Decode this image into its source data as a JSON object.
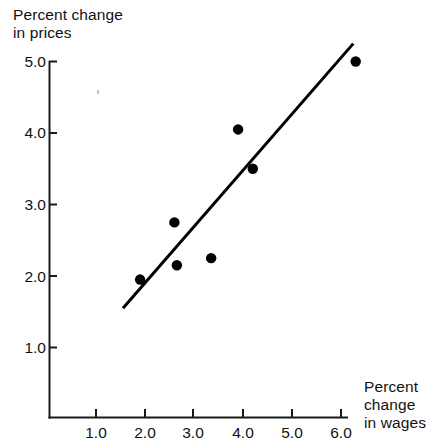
{
  "chart_data": {
    "type": "scatter",
    "title": "",
    "xlabel": "Percent change in wages",
    "ylabel": "Percent change in prices",
    "xlabel_lines": [
      "Percent",
      "change",
      "in wages"
    ],
    "ylabel_lines": [
      "Percent change",
      "in prices"
    ],
    "x_ticks": [
      "1.0",
      "2.0",
      "3.0",
      "4.0",
      "5.0",
      "6.0"
    ],
    "x_tick_values": [
      1.0,
      2.0,
      3.0,
      4.0,
      5.0,
      6.0
    ],
    "y_ticks": [
      "1.0",
      "2.0",
      "3.0",
      "4.0",
      "5.0"
    ],
    "y_tick_values": [
      1.0,
      2.0,
      3.0,
      4.0,
      5.0
    ],
    "xlim": [
      0.0,
      6.6
    ],
    "ylim": [
      0.5,
      5.2
    ],
    "grid": false,
    "legend": null,
    "points": [
      {
        "x": 1.9,
        "y": 1.95
      },
      {
        "x": 2.6,
        "y": 2.75
      },
      {
        "x": 2.65,
        "y": 2.15
      },
      {
        "x": 3.35,
        "y": 2.25
      },
      {
        "x": 3.9,
        "y": 4.05
      },
      {
        "x": 4.2,
        "y": 3.5
      },
      {
        "x": 6.3,
        "y": 5.0
      }
    ],
    "trend_line": {
      "type": "best-fit-line",
      "x_start": 1.55,
      "y_start": 1.55,
      "x_end": 6.25,
      "y_end": 5.25
    },
    "marker_color": "#000000",
    "line_color": "#000000",
    "axis_color": "#1a1a1a",
    "background_color": "#ffffff"
  },
  "axis_labels": {
    "y_title_line1": "Percent change",
    "y_title_line2": "in prices",
    "x_title_line1": "Percent",
    "x_title_line2": "change",
    "x_title_line3": "in wages"
  },
  "y_tick_labels": [
    "5.0",
    "4.0",
    "3.0",
    "2.0",
    "1.0"
  ],
  "x_tick_labels": [
    "1.0",
    "2.0",
    "3.0",
    "4.0",
    "5.0",
    "6.0"
  ]
}
